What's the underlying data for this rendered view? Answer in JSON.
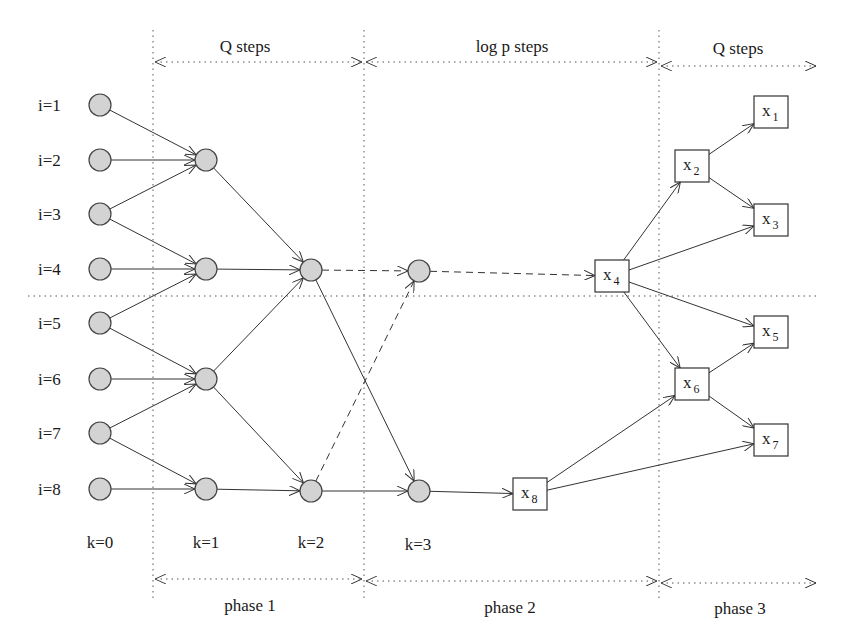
{
  "diagram": {
    "top_spans": [
      {
        "label": "Q steps",
        "x1": 153,
        "x2": 364,
        "y": 62,
        "label_x": 245,
        "label_y": 52
      },
      {
        "label": "log p  steps",
        "x1": 364,
        "x2": 659,
        "y": 62,
        "label_x": 512,
        "label_y": 52
      },
      {
        "label": "Q steps",
        "x1": 659,
        "x2": 818,
        "y": 66,
        "label_x": 738,
        "label_y": 54
      }
    ],
    "bottom_spans": [
      {
        "label": "phase 1",
        "x1": 153,
        "x2": 364,
        "y": 579,
        "label_x": 250,
        "label_y": 611
      },
      {
        "label": "phase 2",
        "x1": 364,
        "x2": 659,
        "y": 581,
        "label_x": 510,
        "label_y": 613
      },
      {
        "label": "phase 3",
        "x1": 659,
        "x2": 818,
        "y": 583,
        "label_x": 740,
        "label_y": 614
      }
    ],
    "vertical_guides": [
      153,
      364,
      659
    ],
    "horizontal_guide": {
      "y": 296,
      "x1": 28,
      "x2": 820
    },
    "row_labels": [
      {
        "label": "i=1",
        "y": 105
      },
      {
        "label": "i=2",
        "y": 160
      },
      {
        "label": "i=3",
        "y": 214
      },
      {
        "label": "i=4",
        "y": 269
      },
      {
        "label": "i=5",
        "y": 323
      },
      {
        "label": "i=6",
        "y": 379
      },
      {
        "label": "i=7",
        "y": 433
      },
      {
        "label": "i=8",
        "y": 489
      }
    ],
    "column_labels": [
      {
        "label": "k=0",
        "x": 100,
        "y": 548
      },
      {
        "label": "k=1",
        "x": 206,
        "y": 548
      },
      {
        "label": "k=2",
        "x": 311,
        "y": 548
      },
      {
        "label": "k=3",
        "x": 418,
        "y": 550
      }
    ],
    "circles": [
      {
        "id": "c0_1",
        "x": 100,
        "y": 105
      },
      {
        "id": "c0_2",
        "x": 100,
        "y": 160
      },
      {
        "id": "c0_3",
        "x": 100,
        "y": 214
      },
      {
        "id": "c0_4",
        "x": 100,
        "y": 269
      },
      {
        "id": "c0_5",
        "x": 100,
        "y": 323
      },
      {
        "id": "c0_6",
        "x": 100,
        "y": 379
      },
      {
        "id": "c0_7",
        "x": 100,
        "y": 433
      },
      {
        "id": "c0_8",
        "x": 100,
        "y": 489
      },
      {
        "id": "c1_2",
        "x": 206,
        "y": 160
      },
      {
        "id": "c1_4",
        "x": 206,
        "y": 269
      },
      {
        "id": "c1_6",
        "x": 206,
        "y": 379
      },
      {
        "id": "c1_8",
        "x": 206,
        "y": 489
      },
      {
        "id": "c2_4",
        "x": 311,
        "y": 270
      },
      {
        "id": "c2_8",
        "x": 311,
        "y": 491
      },
      {
        "id": "c3_4",
        "x": 419,
        "y": 271
      },
      {
        "id": "c3_8",
        "x": 419,
        "y": 491
      }
    ],
    "boxes": [
      {
        "id": "x1",
        "base": "x",
        "sub": "1",
        "x": 771,
        "y": 112
      },
      {
        "id": "x2",
        "base": "x",
        "sub": "2",
        "x": 692,
        "y": 166
      },
      {
        "id": "x3",
        "base": "x",
        "sub": "3",
        "x": 771,
        "y": 220
      },
      {
        "id": "x4",
        "base": "x",
        "sub": "4",
        "x": 612,
        "y": 276
      },
      {
        "id": "x5",
        "base": "x",
        "sub": "5",
        "x": 771,
        "y": 332
      },
      {
        "id": "x6",
        "base": "x",
        "sub": "6",
        "x": 692,
        "y": 384
      },
      {
        "id": "x7",
        "base": "x",
        "sub": "7",
        "x": 771,
        "y": 440
      },
      {
        "id": "x8",
        "base": "x",
        "sub": "8",
        "x": 530,
        "y": 494
      }
    ],
    "edges": [
      {
        "from": "c0_1",
        "to": "c1_2",
        "style": "solid"
      },
      {
        "from": "c0_2",
        "to": "c1_2",
        "style": "solid"
      },
      {
        "from": "c0_3",
        "to": "c1_2",
        "style": "solid"
      },
      {
        "from": "c0_3",
        "to": "c1_4",
        "style": "solid"
      },
      {
        "from": "c0_4",
        "to": "c1_4",
        "style": "solid"
      },
      {
        "from": "c0_5",
        "to": "c1_4",
        "style": "solid"
      },
      {
        "from": "c0_5",
        "to": "c1_6",
        "style": "solid"
      },
      {
        "from": "c0_6",
        "to": "c1_6",
        "style": "solid"
      },
      {
        "from": "c0_7",
        "to": "c1_6",
        "style": "solid"
      },
      {
        "from": "c0_7",
        "to": "c1_8",
        "style": "solid"
      },
      {
        "from": "c0_8",
        "to": "c1_8",
        "style": "solid"
      },
      {
        "from": "c1_2",
        "to": "c2_4",
        "style": "solid"
      },
      {
        "from": "c1_4",
        "to": "c2_4",
        "style": "solid"
      },
      {
        "from": "c1_6",
        "to": "c2_4",
        "style": "solid"
      },
      {
        "from": "c1_6",
        "to": "c2_8",
        "style": "solid"
      },
      {
        "from": "c1_8",
        "to": "c2_8",
        "style": "solid"
      },
      {
        "from": "c2_4",
        "to": "c3_4",
        "style": "dashed"
      },
      {
        "from": "c2_8",
        "to": "c3_4",
        "style": "dashed"
      },
      {
        "from": "c2_4",
        "to": "c3_8",
        "style": "solid"
      },
      {
        "from": "c2_8",
        "to": "c3_8",
        "style": "solid"
      },
      {
        "from": "c3_4",
        "to": "x4",
        "style": "dashed"
      },
      {
        "from": "c3_8",
        "to": "x8",
        "style": "solid"
      },
      {
        "from": "x4",
        "to": "x2",
        "style": "solid"
      },
      {
        "from": "x4",
        "to": "x3",
        "style": "solid"
      },
      {
        "from": "x4",
        "to": "x5",
        "style": "solid"
      },
      {
        "from": "x4",
        "to": "x6",
        "style": "solid"
      },
      {
        "from": "x2",
        "to": "x1",
        "style": "solid"
      },
      {
        "from": "x2",
        "to": "x3",
        "style": "solid"
      },
      {
        "from": "x6",
        "to": "x5",
        "style": "solid"
      },
      {
        "from": "x6",
        "to": "x7",
        "style": "solid"
      },
      {
        "from": "x8",
        "to": "x6",
        "style": "solid"
      },
      {
        "from": "x8",
        "to": "x7",
        "style": "solid"
      }
    ]
  }
}
